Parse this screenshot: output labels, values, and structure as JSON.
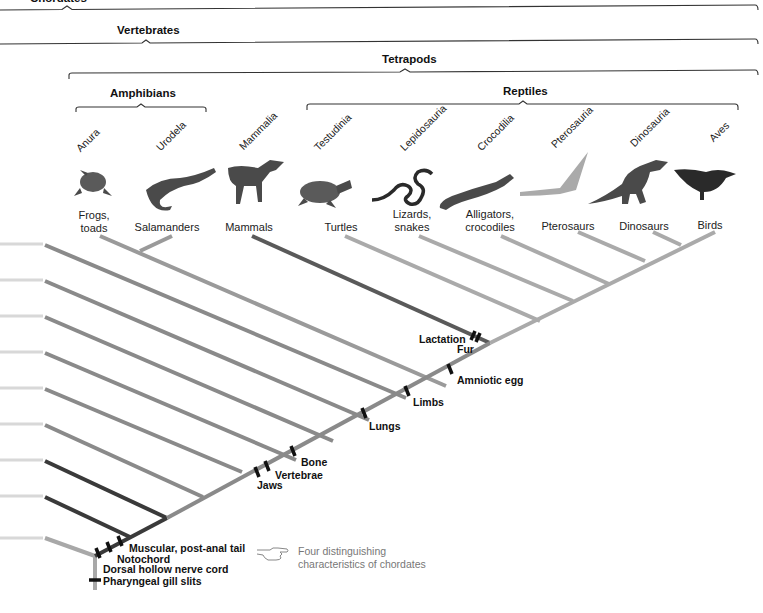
{
  "diagram": {
    "clades": {
      "chordates": "Chordates",
      "vertebrates": "Vertebrates",
      "tetrapods": "Tetrapods",
      "amphibians": "Amphibians",
      "reptiles": "Reptiles"
    },
    "taxa": [
      {
        "group": "Anura",
        "common": "Frogs,\ntoads",
        "common_l1": "Frogs,",
        "common_l2": "toads"
      },
      {
        "group": "Urodela",
        "common_l1": "Salamanders",
        "common_l2": ""
      },
      {
        "group": "Mammalia",
        "common_l1": "Mammals",
        "common_l2": ""
      },
      {
        "group": "Testudinia",
        "common_l1": "Turtles",
        "common_l2": ""
      },
      {
        "group": "Lepidosauria",
        "common_l1": "Lizards,",
        "common_l2": "snakes"
      },
      {
        "group": "Crocodilia",
        "common_l1": "Alligators,",
        "common_l2": "crocodiles"
      },
      {
        "group": "Pterosauria",
        "common_l1": "Pterosaurs",
        "common_l2": ""
      },
      {
        "group": "Dinosauria",
        "common_l1": "Dinosaurs",
        "common_l2": ""
      },
      {
        "group": "Aves",
        "common_l1": "Birds",
        "common_l2": ""
      }
    ],
    "traits": {
      "lactation": "Lactation",
      "fur": "Fur",
      "amniotic_egg": "Amniotic egg",
      "limbs": "Limbs",
      "lungs": "Lungs",
      "bone": "Bone",
      "vertebrae": "Vertebrae",
      "jaws": "Jaws",
      "muscular_tail": "Muscular, post-anal tail",
      "notochord": "Notochord",
      "nerve_cord": "Dorsal hollow nerve cord",
      "gill_slits": "Pharyngeal gill slits"
    },
    "note": {
      "icon": "pointing-hand-icon",
      "line1": "Four distinguishing",
      "line2": "characteristics of chordates"
    },
    "colors": {
      "branch": "#8a8a8a",
      "branch_light": "#a8a8a8",
      "branch_dark": "#3a3a3a",
      "mammal_branch": "#5a5a5a",
      "stub": "#d8d8d8",
      "tick": "#111111",
      "bracket": "#333333"
    }
  }
}
